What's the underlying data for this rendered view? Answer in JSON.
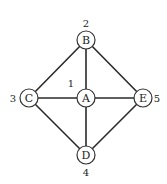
{
  "diagram": {
    "type": "graph",
    "nodes": [
      {
        "id": "A",
        "label": "A",
        "number": "1",
        "x": 86,
        "y": 98,
        "num_x": 71,
        "num_y": 83
      },
      {
        "id": "B",
        "label": "B",
        "number": "2",
        "x": 86,
        "y": 40,
        "num_x": 86,
        "num_y": 23
      },
      {
        "id": "C",
        "label": "C",
        "number": "3",
        "x": 29,
        "y": 98,
        "num_x": 13,
        "num_y": 98
      },
      {
        "id": "D",
        "label": "D",
        "number": "4",
        "x": 86,
        "y": 155,
        "num_x": 86,
        "num_y": 172
      },
      {
        "id": "E",
        "label": "E",
        "number": "5",
        "x": 143,
        "y": 98,
        "num_x": 157,
        "num_y": 98
      }
    ],
    "edges": [
      [
        "B",
        "C"
      ],
      [
        "B",
        "A"
      ],
      [
        "B",
        "E"
      ],
      [
        "C",
        "A"
      ],
      [
        "A",
        "E"
      ],
      [
        "C",
        "D"
      ],
      [
        "A",
        "D"
      ],
      [
        "E",
        "D"
      ]
    ],
    "node_radius": 9,
    "colors": {
      "stroke": "#2a2a2a",
      "fill": "#ffffff",
      "text": "#222222"
    }
  }
}
